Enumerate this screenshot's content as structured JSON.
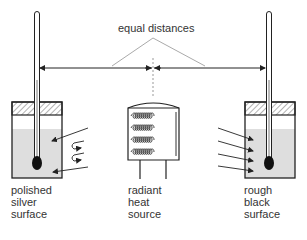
{
  "diagram": {
    "type": "physics-experiment",
    "annotation": "equal distances",
    "left_container": {
      "label_lines": [
        "polished",
        "silver",
        "surface"
      ],
      "behaviour": "reflects radiation"
    },
    "center_source": {
      "label_lines": [
        "radiant",
        "heat",
        "source"
      ]
    },
    "right_container": {
      "label_lines": [
        "rough",
        "black",
        "surface"
      ],
      "behaviour": "absorbs radiation"
    },
    "icons": [
      "thermometer-icon",
      "heater-coil-icon",
      "radiation-arrow-icon",
      "reflection-arrow-icon"
    ],
    "colors": {
      "line": "#2a2a2a",
      "liquid": "#dedede",
      "hatch": "#555555",
      "guide": "#a8a8a8"
    }
  }
}
